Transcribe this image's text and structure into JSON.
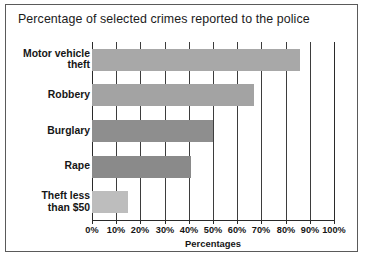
{
  "chart_data": {
    "type": "bar",
    "orientation": "horizontal",
    "title": "Percentage of selected crimes reported to the police",
    "xlabel": "Percentages",
    "ylabel": "",
    "xlim": [
      0,
      100
    ],
    "grid": true,
    "legend": "none",
    "categories": [
      "Motor vehicle theft",
      "Robbery",
      "Burglary",
      "Rape",
      "Theft less than $50"
    ],
    "values": [
      86,
      67,
      50,
      41,
      15
    ],
    "xticks": [
      0,
      10,
      20,
      30,
      40,
      50,
      60,
      70,
      80,
      90,
      100
    ],
    "xticklabels": [
      "0%",
      "10%",
      "20%",
      "30%",
      "40%",
      "50%",
      "60%",
      "70%",
      "80%",
      "90%",
      "100%"
    ],
    "bars": [
      {
        "label_line1": "Motor vehicle",
        "label_line2": "theft",
        "label": "Motor vehicle theft",
        "value": 86,
        "color": "#a8a8a8"
      },
      {
        "label_line1": "Robbery",
        "label_line2": "",
        "label": "Robbery",
        "value": 67,
        "color": "#a3a3a3"
      },
      {
        "label_line1": "Burglary",
        "label_line2": "",
        "label": "Burglary",
        "value": 50,
        "color": "#8e8e8e"
      },
      {
        "label_line1": "Rape",
        "label_line2": "",
        "label": "Rape",
        "value": 41,
        "color": "#8a8a8a"
      },
      {
        "label_line1": "Theft less",
        "label_line2": "than $50",
        "label": "Theft less than $50",
        "value": 15,
        "color": "#bdbdbd"
      }
    ]
  },
  "style": {
    "background": "#ffffff",
    "frame_color": "#5a5a5a",
    "grid_color": "#3d3d3d",
    "axis_color": "#2a2a2a",
    "text_color": "#161616"
  }
}
